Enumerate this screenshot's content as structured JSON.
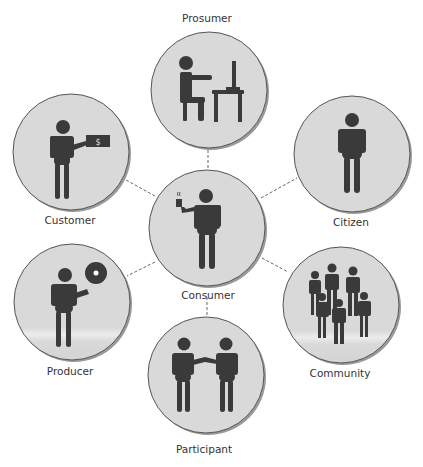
{
  "diagram": {
    "center": {
      "id": "consumer",
      "label": "Consumer",
      "icon": "person-holding-cup-icon"
    },
    "nodes": [
      {
        "id": "prosumer",
        "label": "Prosumer",
        "icon": "person-at-computer-desk-icon"
      },
      {
        "id": "customer",
        "label": "Customer",
        "icon": "person-holding-money-icon"
      },
      {
        "id": "citizen",
        "label": "Citizen",
        "icon": "person-standing-icon"
      },
      {
        "id": "producer",
        "label": "Producer",
        "icon": "person-holding-disc-icon"
      },
      {
        "id": "community",
        "label": "Community",
        "icon": "group-of-people-icon"
      },
      {
        "id": "participant",
        "label": "Participant",
        "icon": "two-people-shaking-hands-icon"
      }
    ],
    "edges": [
      [
        "consumer",
        "prosumer"
      ],
      [
        "consumer",
        "customer"
      ],
      [
        "consumer",
        "citizen"
      ],
      [
        "consumer",
        "producer"
      ],
      [
        "consumer",
        "community"
      ],
      [
        "consumer",
        "participant"
      ]
    ],
    "money_symbol": "$",
    "colors": {
      "circle_fill": "#d9d9d9",
      "circle_stroke": "#555555",
      "figure": "#3a3a3a",
      "edge": "#666666"
    }
  }
}
